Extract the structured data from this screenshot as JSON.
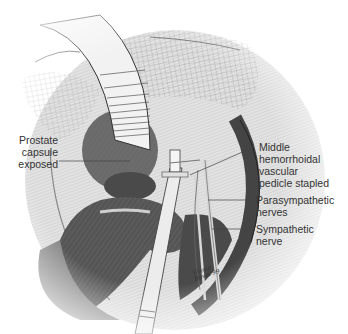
{
  "figure": {
    "type": "surgical-illustration",
    "palette": {
      "background": "#ffffff",
      "dark_tissue": "#555555",
      "mid_tissue": "#8a8a8a",
      "light_tissue": "#d6d6d6",
      "retractor": "#eeeeee",
      "line": "#333333"
    },
    "labels": {
      "prostate": {
        "lines": [
          "Prostate",
          "capsule",
          "exposed"
        ]
      },
      "pedicle": {
        "lines": [
          "Middle",
          "hemorrhoidal",
          "vascular",
          "pedicle stapled"
        ]
      },
      "parasympathetic": {
        "lines": [
          "Parasympathetic",
          "nerves"
        ]
      },
      "sympathetic": {
        "lines": [
          "Sympathetic",
          "nerve"
        ]
      }
    },
    "signature": [
      "Vinnie",
      "Bevel'99"
    ]
  }
}
